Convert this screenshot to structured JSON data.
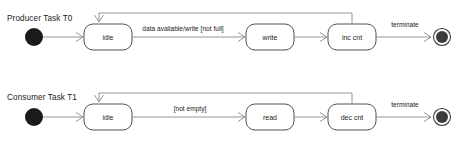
{
  "canvas": {
    "width": 467,
    "height": 143,
    "background": "#ffffff"
  },
  "colors": {
    "state_stroke": "#3c3c3c",
    "state_fill": "#ffffff",
    "edge": "#8a8a8a",
    "text": "#1b1b1b",
    "initial_state": "#1a1a1a",
    "final_state": "#3b3b3b"
  },
  "lanes": [
    {
      "id": "producer",
      "title": "Producer Task T0",
      "states": [
        {
          "id": "p-initial",
          "kind": "initial",
          "label": ""
        },
        {
          "id": "p-idle",
          "kind": "state",
          "label": "idle"
        },
        {
          "id": "p-write",
          "kind": "state",
          "label": "write"
        },
        {
          "id": "p-inc",
          "kind": "state",
          "label": "inc cnt"
        },
        {
          "id": "p-final",
          "kind": "final",
          "label": ""
        }
      ],
      "transitions": [
        {
          "id": "p-t1",
          "from": "p-initial",
          "to": "p-idle",
          "label": ""
        },
        {
          "id": "p-t2",
          "from": "p-idle",
          "to": "p-write",
          "label": "data available/write [not full]"
        },
        {
          "id": "p-t3",
          "from": "p-write",
          "to": "p-inc",
          "label": ""
        },
        {
          "id": "p-t4",
          "from": "p-inc",
          "to": "p-final",
          "label": "terminate"
        },
        {
          "id": "p-t5",
          "from": "p-inc",
          "to": "p-idle",
          "label": "",
          "kind": "feedback"
        }
      ]
    },
    {
      "id": "consumer",
      "title": "Consumer Task T1",
      "states": [
        {
          "id": "c-initial",
          "kind": "initial",
          "label": ""
        },
        {
          "id": "c-idle",
          "kind": "state",
          "label": "idle"
        },
        {
          "id": "c-read",
          "kind": "state",
          "label": "read"
        },
        {
          "id": "c-dec",
          "kind": "state",
          "label": "dec cnt"
        },
        {
          "id": "c-final",
          "kind": "final",
          "label": ""
        }
      ],
      "transitions": [
        {
          "id": "c-t1",
          "from": "c-initial",
          "to": "c-idle",
          "label": ""
        },
        {
          "id": "c-t2",
          "from": "c-idle",
          "to": "c-read",
          "label": "[not empty]"
        },
        {
          "id": "c-t3",
          "from": "c-read",
          "to": "c-dec",
          "label": ""
        },
        {
          "id": "c-t4",
          "from": "c-dec",
          "to": "c-final",
          "label": "terminate"
        },
        {
          "id": "c-t5",
          "from": "c-dec",
          "to": "c-idle",
          "label": "",
          "kind": "feedback"
        }
      ]
    }
  ]
}
